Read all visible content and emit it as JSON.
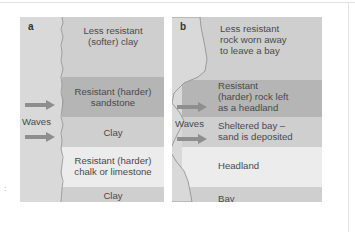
{
  "colors": {
    "sea": "#d7d7d7",
    "clay": "#cfcfcf",
    "resistant_dark": "#b5b5b5",
    "resistant_light": "#ececec",
    "arrow": "#8e8e8e",
    "text": "#4a4a4a"
  },
  "panel_a": {
    "letter": "a",
    "waves_label": "Waves",
    "bands": [
      {
        "line1": "Less resistant",
        "line2": "(softer) clay"
      },
      {
        "line1": "Resistant (harder)",
        "line2": "sandstone"
      },
      {
        "line1": "Clay",
        "line2": ""
      },
      {
        "line1": "Resistant (harder)",
        "line2": "chalk or limestone"
      },
      {
        "line1": "Clay",
        "line2": ""
      }
    ]
  },
  "panel_b": {
    "letter": "b",
    "waves_label": "Waves",
    "bands": [
      {
        "line1": "Less resistant",
        "line2": "rock worn away",
        "line3": "to leave a bay"
      },
      {
        "line1": "Resistant",
        "line2": "(harder) rock left",
        "line3": "as a headland"
      },
      {
        "line1": "Sheltered bay –",
        "line2": "sand is deposited"
      },
      {
        "line1": "Headland"
      },
      {
        "line1": "Bay"
      }
    ]
  },
  "icons": [
    "wave-arrow-icon"
  ]
}
